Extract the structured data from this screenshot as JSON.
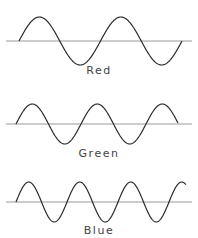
{
  "waves": [
    {
      "name": "red",
      "label": "Red",
      "axis_y": 41,
      "axis_x": [
        6,
        192
      ],
      "start_x": 19,
      "end_x": 182,
      "period": 81.5,
      "amplitude": 24,
      "label_y": 64
    },
    {
      "name": "green",
      "label": "Green",
      "axis_y": 124,
      "axis_x": [
        6,
        192
      ],
      "start_x": 16,
      "end_x": 178,
      "period": 65,
      "amplitude": 20,
      "label_y": 147
    },
    {
      "name": "blue",
      "label": "Blue",
      "axis_y": 202,
      "axis_x": [
        6,
        192
      ],
      "start_x": 16,
      "end_x": 186,
      "period": 51,
      "amplitude": 20,
      "label_y": 224
    }
  ],
  "stroke_color": "#2b2b2b",
  "axis_color": "#9a9a9a"
}
